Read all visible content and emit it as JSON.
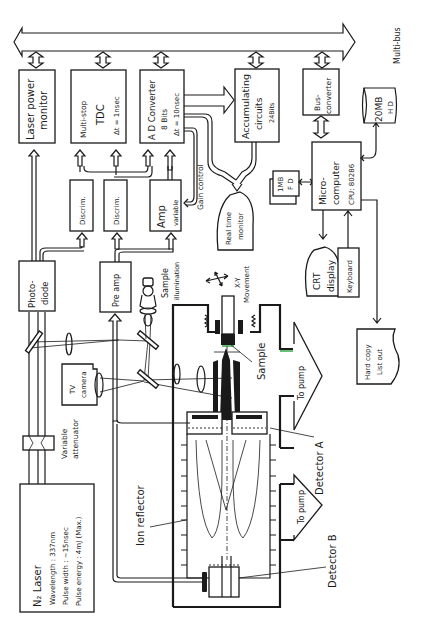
{
  "diagram": {
    "bus": {
      "label": "Multi-bus"
    },
    "blocks": {
      "laser_power_monitor": {
        "line1": "Laser power",
        "line2": "monitor"
      },
      "tdc": {
        "line1": "Multi-stop",
        "line2": "TDC",
        "line3": "Δt = 1nsec"
      },
      "ad_converter": {
        "line1": "A D Converter",
        "line2": "8 Bits",
        "line3": "Δt = 10nsec"
      },
      "accumulating": {
        "line1": "Accumulating",
        "line2": "circuits",
        "line3": "24Bits"
      },
      "bus_converter": {
        "line1": "Bus-",
        "line2": "converter"
      },
      "hard_disk": {
        "line1": "20MB",
        "line2": "H D"
      },
      "discrim_1": {
        "label": "Discrim."
      },
      "discrim_2": {
        "label": "Discrim."
      },
      "amp": {
        "line1": "Amp",
        "line2": "variable"
      },
      "gain_control": {
        "label": "Gain control"
      },
      "realtime_monitor": {
        "line1": "Real time",
        "line2": "monitor"
      },
      "floppy": {
        "line1": "1MB",
        "line2": "F D"
      },
      "microcomputer": {
        "line1": "Micro-",
        "line2": "computer",
        "line3": "CPU: 80286"
      },
      "photodiode": {
        "line1": "Photo-",
        "line2": "diode"
      },
      "preamp": {
        "label": "Pre amp"
      },
      "sample_illumination": {
        "line1": "Sample",
        "line2": "illumination"
      },
      "xy_movement": {
        "line1": "X-Y",
        "line2": "Movement"
      },
      "crt_display": {
        "line1": "CRT",
        "line2": "display"
      },
      "keyboard": {
        "label": "Keyboard"
      },
      "hard_copy": {
        "line1": "Hard copy",
        "line2": "List out"
      },
      "tv_camera": {
        "line1": "TV",
        "line2": "camera"
      },
      "variable_attenuator": {
        "line1": "Variable",
        "line2": "attenuator"
      },
      "sample": {
        "label": "Sample"
      },
      "to_pump_a": {
        "label": "To pump"
      },
      "to_pump_b": {
        "label": "To pump"
      },
      "detector_a": {
        "label": "Detector A"
      },
      "detector_b": {
        "label": "Detector B"
      },
      "ion_reflector": {
        "label": "Ion reflector"
      },
      "n2_laser": {
        "line1": "N₂ Laser",
        "line2": "Wavelength : 337nm",
        "line3": "Pulse width : ~15nsec",
        "line4": "Pulse energy : 4mJ (Max.)"
      }
    },
    "colors": {
      "ink": "#1a1a1a",
      "background": "#ffffff",
      "accent_green": "#3aa84a"
    }
  }
}
